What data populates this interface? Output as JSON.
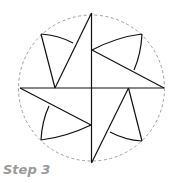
{
  "caption": "Step 3",
  "diagram": {
    "type": "geometric-star-construction",
    "circle": {
      "cx": 91,
      "cy": 88,
      "r": 73,
      "style": "dashed",
      "color": "#888888"
    },
    "stroke_color": "#111111"
  }
}
